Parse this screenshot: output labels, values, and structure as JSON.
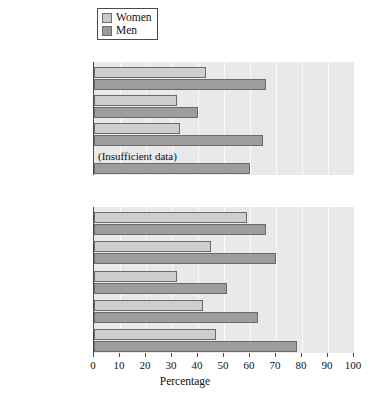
{
  "legend": {
    "items": [
      {
        "label": "Women",
        "color": "#cecece",
        "icon": "square-swatch-icon"
      },
      {
        "label": "Men",
        "color": "#9d9d9d",
        "icon": "square-swatch-icon"
      }
    ]
  },
  "chart_data": {
    "type": "bar",
    "orientation": "horizontal",
    "title": "",
    "xlabel": "Percentage",
    "ylabel": "",
    "xlim": [
      0,
      100
    ],
    "xticks": [
      0,
      10,
      20,
      30,
      40,
      50,
      60,
      70,
      80,
      90,
      100
    ],
    "grid": true,
    "legend_position": "top-center",
    "series": [
      {
        "name": "Women",
        "color": "#cecece"
      },
      {
        "name": "Men",
        "color": "#9d9d9d"
      }
    ],
    "panels": [
      {
        "title": "Race/ethnicity",
        "categories": [
          "White",
          "Black",
          "Hispanic",
          "Asian"
        ],
        "values": {
          "Women": [
            43,
            32,
            33,
            null
          ],
          "Men": [
            66,
            40,
            65,
            60
          ]
        },
        "annotations": [
          {
            "category": "Asian",
            "series": "Women",
            "text": "(Insufficient data)"
          }
        ]
      },
      {
        "title": "Religion",
        "categories": [
          "None",
          "Mainstream Protestant",
          "Fundamentalist Protestant",
          "Roman Catholic",
          "Other"
        ],
        "values": {
          "Women": [
            59,
            45,
            32,
            42,
            47
          ],
          "Men": [
            66,
            70,
            51,
            63,
            78
          ]
        },
        "annotations": []
      }
    ]
  }
}
